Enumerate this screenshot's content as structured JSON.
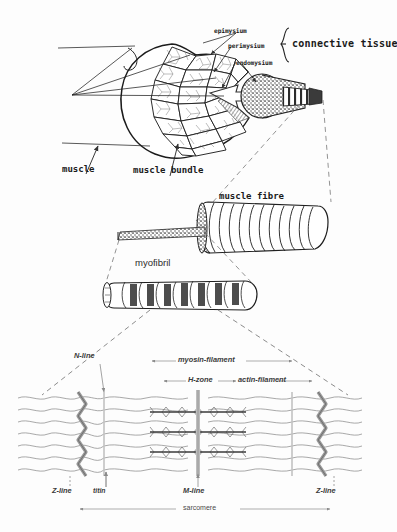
{
  "figure": {
    "background_color": "#fdfdfd",
    "ink_color": "#1a1a1a"
  },
  "top_panel": {
    "labels": {
      "epimysium": "epimysium",
      "perimysium": "perimysium",
      "endomysium": "endomysium",
      "connective_tissue": "connective tissue",
      "muscle": "muscle",
      "muscle_bundle": "muscle bundle"
    }
  },
  "mid_panel": {
    "labels": {
      "muscle_fibre": "muscle fibre",
      "myofibril": "myofibril"
    }
  },
  "sarcomere_panel": {
    "labels": {
      "n_line": "N-line",
      "myosin_filament": "myosin-filament",
      "h_zone": "H-zone",
      "actin_filament": "actin-filament",
      "z_line_left": "Z-line",
      "z_line_right": "Z-line",
      "titin": "titin",
      "m_line": "M-line",
      "sarcomere": "sarcomere"
    }
  }
}
